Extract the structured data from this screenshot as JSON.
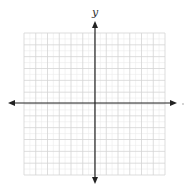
{
  "diagram": {
    "type": "coordinate-grid",
    "y_axis_label": "y",
    "x_axis_label": "",
    "grid": {
      "left": 24,
      "top": 33,
      "right": 165,
      "bottom": 175,
      "major_cells": 12,
      "minor_per_major": 2,
      "major_color": "#d4d4d4",
      "minor_color": "#ececec"
    },
    "axes": {
      "origin_x": 95,
      "origin_y": 103,
      "x_start": 8,
      "x_end": 177,
      "y_start": 21,
      "y_end": 184,
      "color": "#222222"
    }
  }
}
